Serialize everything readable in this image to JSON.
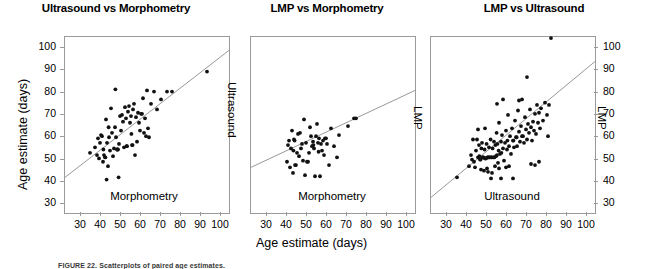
{
  "figure": {
    "shared_x_axis_title": "Age estimate (days)",
    "shared_y_axis_title": "Age estimate (days)",
    "caption": "FIGURE 22. Scatterplots of paired age estimates."
  },
  "axis": {
    "y_ticks": [
      "100",
      "90",
      "80",
      "70",
      "60",
      "50",
      "40",
      "30"
    ],
    "x_ticks": [
      "30",
      "40",
      "50",
      "60",
      "70",
      "80",
      "90",
      "100"
    ]
  },
  "chart_data": [
    {
      "type": "scatter",
      "title": "Ultrasound vs Morphometry",
      "xlabel": "Morphometry",
      "ylabel": "Ultrasound",
      "xlim": [
        22,
        104
      ],
      "ylim": [
        26,
        105
      ],
      "xticks": [
        30,
        40,
        50,
        60,
        70,
        80,
        90,
        100
      ],
      "yticks": [
        30,
        40,
        50,
        60,
        70,
        80,
        90,
        100
      ],
      "grid": false,
      "legend": "none",
      "regression_line": {
        "x": [
          22,
          104
        ],
        "y": [
          42.0,
          99.0
        ]
      },
      "points": [
        [
          34.5,
          53.0
        ],
        [
          37.0,
          55.5
        ],
        [
          38.0,
          52.0
        ],
        [
          38.5,
          59.5
        ],
        [
          39.0,
          50.5
        ],
        [
          39.5,
          57.5
        ],
        [
          40.0,
          61.0
        ],
        [
          40.5,
          60.5
        ],
        [
          41.0,
          49.0
        ],
        [
          41.2,
          54.5
        ],
        [
          41.5,
          52.0
        ],
        [
          42.0,
          51.0
        ],
        [
          42.2,
          51.0
        ],
        [
          42.5,
          68.0
        ],
        [
          42.8,
          41.0
        ],
        [
          43.0,
          57.5
        ],
        [
          43.5,
          47.0
        ],
        [
          43.8,
          64.5
        ],
        [
          44.0,
          60.0
        ],
        [
          44.5,
          54.0
        ],
        [
          45.0,
          73.0
        ],
        [
          45.5,
          62.0
        ],
        [
          46.0,
          51.5
        ],
        [
          46.5,
          55.0
        ],
        [
          47.0,
          64.5
        ],
        [
          47.2,
          81.5
        ],
        [
          47.5,
          60.0
        ],
        [
          48.0,
          54.5
        ],
        [
          48.2,
          54.5
        ],
        [
          48.5,
          54.5
        ],
        [
          48.8,
          42.0
        ],
        [
          49.0,
          57.0
        ],
        [
          49.5,
          69.5
        ],
        [
          50.0,
          63.0
        ],
        [
          50.5,
          70.0
        ],
        [
          51.0,
          67.0
        ],
        [
          51.5,
          55.5
        ],
        [
          52.0,
          73.5
        ],
        [
          52.5,
          68.5
        ],
        [
          52.8,
          56.0
        ],
        [
          53.0,
          56.0
        ],
        [
          53.5,
          71.5
        ],
        [
          54.0,
          74.0
        ],
        [
          54.5,
          66.5
        ],
        [
          55.0,
          69.5
        ],
        [
          55.2,
          61.5
        ],
        [
          55.5,
          56.5
        ],
        [
          55.8,
          56.5
        ],
        [
          56.0,
          72.5
        ],
        [
          56.5,
          75.0
        ],
        [
          57.0,
          52.0
        ],
        [
          57.5,
          69.0
        ],
        [
          58.0,
          58.0
        ],
        [
          58.5,
          71.0
        ],
        [
          59.0,
          66.5
        ],
        [
          59.5,
          63.0
        ],
        [
          60.0,
          70.5
        ],
        [
          60.5,
          70.5
        ],
        [
          61.0,
          77.5
        ],
        [
          61.5,
          62.0
        ],
        [
          62.0,
          68.5
        ],
        [
          62.5,
          60.5
        ],
        [
          63.0,
          81.0
        ],
        [
          63.5,
          64.0
        ],
        [
          64.0,
          60.0
        ],
        [
          65.0,
          75.0
        ],
        [
          66.5,
          80.5
        ],
        [
          68.0,
          72.5
        ],
        [
          70.0,
          77.0
        ],
        [
          73.0,
          80.5
        ],
        [
          75.5,
          80.5
        ],
        [
          93.0,
          89.5
        ]
      ]
    },
    {
      "type": "scatter",
      "title": "LMP vs Morphometry",
      "xlabel": "Morphometry",
      "ylabel": "LMP",
      "xlim": [
        22,
        104
      ],
      "ylim": [
        26,
        105
      ],
      "xticks": [
        30,
        40,
        50,
        60,
        70,
        80,
        90,
        100
      ],
      "yticks": [
        30,
        40,
        50,
        60,
        70,
        80,
        90,
        100
      ],
      "grid": false,
      "legend": "none",
      "regression_line": {
        "x": [
          22,
          104
        ],
        "y": [
          46.5,
          81.0
        ]
      },
      "points": [
        [
          40.0,
          49.0
        ],
        [
          40.5,
          56.5
        ],
        [
          41.0,
          58.5
        ],
        [
          41.5,
          46.5
        ],
        [
          42.0,
          55.0
        ],
        [
          42.5,
          63.0
        ],
        [
          43.0,
          44.0
        ],
        [
          43.2,
          54.0
        ],
        [
          43.5,
          59.0
        ],
        [
          43.8,
          58.5
        ],
        [
          44.0,
          47.5
        ],
        [
          44.5,
          47.5
        ],
        [
          45.0,
          53.0
        ],
        [
          45.5,
          61.5
        ],
        [
          46.0,
          51.5
        ],
        [
          46.5,
          62.0
        ],
        [
          47.0,
          55.0
        ],
        [
          47.5,
          57.0
        ],
        [
          48.0,
          49.5
        ],
        [
          48.5,
          68.0
        ],
        [
          49.0,
          43.0
        ],
        [
          49.5,
          57.5
        ],
        [
          50.0,
          49.0
        ],
        [
          50.5,
          49.0
        ],
        [
          51.0,
          53.0
        ],
        [
          51.5,
          64.5
        ],
        [
          52.0,
          60.5
        ],
        [
          52.5,
          56.0
        ],
        [
          53.0,
          58.0
        ],
        [
          53.2,
          56.5
        ],
        [
          53.5,
          55.0
        ],
        [
          54.0,
          42.5
        ],
        [
          54.5,
          60.5
        ],
        [
          55.0,
          66.0
        ],
        [
          55.5,
          57.5
        ],
        [
          55.8,
          53.5
        ],
        [
          56.0,
          59.5
        ],
        [
          56.5,
          42.5
        ],
        [
          57.0,
          57.0
        ],
        [
          57.5,
          54.0
        ],
        [
          58.0,
          58.5
        ],
        [
          58.5,
          52.0
        ],
        [
          59.0,
          59.5
        ],
        [
          59.5,
          59.5
        ],
        [
          60.0,
          57.0
        ],
        [
          61.0,
          47.5
        ],
        [
          62.0,
          64.0
        ],
        [
          63.5,
          56.0
        ],
        [
          65.0,
          51.0
        ],
        [
          66.0,
          61.0
        ],
        [
          70.5,
          65.0
        ],
        [
          73.5,
          68.5
        ],
        [
          74.5,
          68.5
        ]
      ]
    },
    {
      "type": "scatter",
      "title": "LMP vs Ultrasound",
      "xlabel": "Ultrasound",
      "ylabel": "LMP",
      "xlim": [
        22,
        104
      ],
      "ylim": [
        26,
        105
      ],
      "xticks": [
        30,
        40,
        50,
        60,
        70,
        80,
        90,
        100
      ],
      "yticks": [
        30,
        40,
        50,
        60,
        70,
        80,
        90,
        100
      ],
      "grid": false,
      "legend": "none",
      "regression_line": {
        "x": [
          22,
          104
        ],
        "y": [
          33.0,
          94.0
        ]
      },
      "points": [
        [
          35.0,
          42.0
        ],
        [
          41.0,
          47.0
        ],
        [
          42.0,
          52.0
        ],
        [
          42.5,
          50.0
        ],
        [
          43.0,
          59.0
        ],
        [
          43.5,
          49.0
        ],
        [
          44.0,
          46.5
        ],
        [
          44.5,
          54.0
        ],
        [
          45.0,
          59.0
        ],
        [
          45.5,
          51.0
        ],
        [
          46.0,
          56.5
        ],
        [
          46.2,
          51.5
        ],
        [
          46.5,
          50.0
        ],
        [
          46.8,
          50.0
        ],
        [
          47.0,
          45.5
        ],
        [
          47.2,
          55.0
        ],
        [
          47.5,
          57.5
        ],
        [
          47.8,
          51.0
        ],
        [
          48.0,
          51.0
        ],
        [
          48.2,
          51.0
        ],
        [
          48.5,
          45.0
        ],
        [
          48.8,
          54.5
        ],
        [
          49.0,
          50.5
        ],
        [
          49.2,
          50.5
        ],
        [
          49.5,
          50.5
        ],
        [
          49.8,
          57.0
        ],
        [
          50.0,
          46.0
        ],
        [
          50.2,
          51.0
        ],
        [
          50.5,
          51.0
        ],
        [
          50.8,
          51.0
        ],
        [
          51.0,
          55.5
        ],
        [
          51.2,
          51.0
        ],
        [
          51.5,
          51.0
        ],
        [
          51.8,
          59.0
        ],
        [
          52.0,
          51.0
        ],
        [
          52.2,
          51.0
        ],
        [
          52.5,
          44.0
        ],
        [
          52.8,
          55.0
        ],
        [
          53.0,
          51.0
        ],
        [
          53.2,
          51.0
        ],
        [
          53.5,
          58.0
        ],
        [
          53.8,
          51.0
        ],
        [
          54.0,
          47.0
        ],
        [
          54.2,
          56.5
        ],
        [
          54.5,
          51.5
        ],
        [
          54.8,
          62.0
        ],
        [
          55.0,
          52.0
        ],
        [
          55.2,
          57.0
        ],
        [
          55.5,
          48.5
        ],
        [
          55.8,
          54.0
        ],
        [
          56.0,
          66.5
        ],
        [
          56.5,
          52.5
        ],
        [
          57.0,
          58.0
        ],
        [
          57.2,
          53.0
        ],
        [
          57.5,
          61.0
        ],
        [
          58.0,
          55.0
        ],
        [
          58.5,
          49.5
        ],
        [
          59.0,
          57.5
        ],
        [
          59.5,
          63.0
        ],
        [
          60.0,
          54.5
        ],
        [
          60.2,
          58.5
        ],
        [
          60.5,
          70.0
        ],
        [
          61.0,
          56.0
        ],
        [
          61.5,
          60.5
        ],
        [
          62.0,
          52.5
        ],
        [
          62.5,
          64.0
        ],
        [
          63.0,
          58.5
        ],
        [
          63.2,
          58.5
        ],
        [
          63.5,
          55.5
        ],
        [
          64.0,
          67.5
        ],
        [
          64.5,
          60.0
        ],
        [
          64.8,
          60.0
        ],
        [
          65.0,
          56.0
        ],
        [
          65.5,
          72.0
        ],
        [
          66.0,
          62.5
        ],
        [
          66.5,
          58.0
        ],
        [
          67.0,
          65.0
        ],
        [
          67.5,
          60.5
        ],
        [
          68.0,
          60.5
        ],
        [
          68.5,
          57.5
        ],
        [
          69.0,
          69.0
        ],
        [
          69.5,
          63.5
        ],
        [
          70.0,
          59.0
        ],
        [
          70.5,
          66.0
        ],
        [
          71.0,
          62.0
        ],
        [
          71.5,
          72.5
        ],
        [
          72.0,
          64.5
        ],
        [
          72.5,
          58.5
        ],
        [
          73.0,
          67.0
        ],
        [
          73.5,
          63.0
        ],
        [
          74.0,
          70.5
        ],
        [
          74.5,
          61.5
        ],
        [
          75.0,
          74.5
        ],
        [
          75.5,
          66.5
        ],
        [
          76.0,
          71.0
        ],
        [
          76.5,
          64.0
        ],
        [
          77.0,
          73.0
        ],
        [
          78.0,
          67.5
        ],
        [
          79.0,
          75.5
        ],
        [
          80.0,
          70.0
        ],
        [
          81.0,
          74.5
        ],
        [
          82.0,
          104.5
        ],
        [
          70.0,
          87.0
        ],
        [
          55.0,
          75.0
        ],
        [
          58.0,
          77.0
        ],
        [
          66.0,
          76.5
        ],
        [
          67.5,
          77.0
        ],
        [
          49.0,
          64.0
        ],
        [
          45.5,
          63.5
        ],
        [
          52.0,
          41.5
        ],
        [
          57.0,
          41.5
        ],
        [
          63.0,
          41.5
        ],
        [
          72.0,
          48.0
        ],
        [
          76.0,
          49.0
        ],
        [
          80.5,
          60.5
        ],
        [
          74.0,
          47.5
        ],
        [
          61.0,
          47.0
        ],
        [
          59.5,
          46.5
        ],
        [
          50.5,
          44.5
        ],
        [
          56.0,
          46.0
        ]
      ]
    }
  ]
}
